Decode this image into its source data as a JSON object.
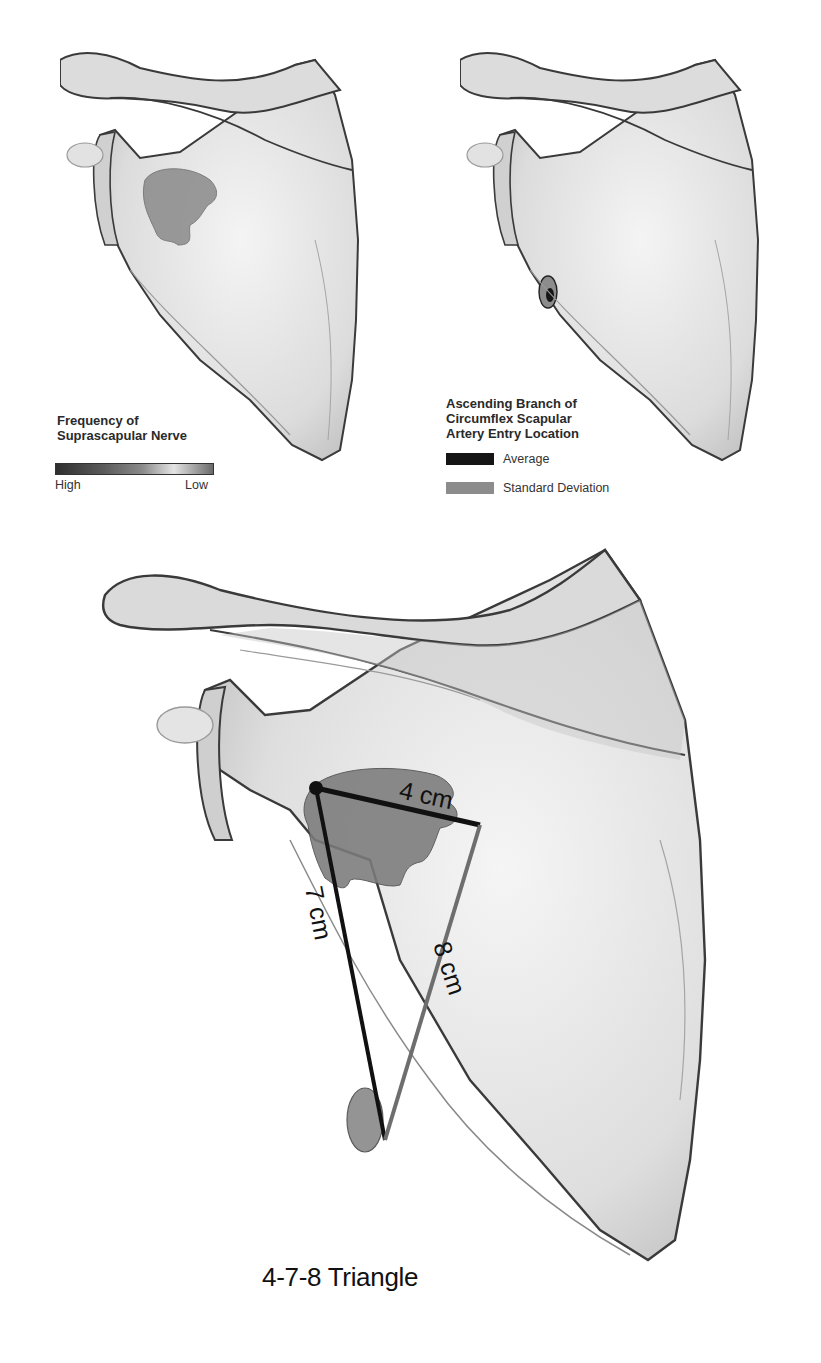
{
  "figure": {
    "panel_a": {
      "legend_title_line1": "Frequency of",
      "legend_title_line2": "Suprascapular Nerve",
      "scale_high": "High",
      "scale_low": "Low"
    },
    "panel_b": {
      "legend_title_line1": "Ascending Branch of",
      "legend_title_line2": "Circumflex Scapular",
      "legend_title_line3": "Artery Entry Location",
      "legend_items": [
        {
          "label": "Average",
          "color": "#151515"
        },
        {
          "label": "Standard Deviation",
          "color": "#8c8c8c"
        }
      ]
    },
    "panel_c": {
      "measurements": {
        "top": "4 cm",
        "left": "7 cm",
        "right": "8 cm"
      },
      "caption": "4-7-8 Triangle"
    }
  },
  "colors": {
    "bone_fill": "#e6e6e6",
    "bone_shade": "#c9c9c9",
    "outline": "#3a3a3a",
    "nerve_zone": "#7a7a7a",
    "triangle_line_dark": "#111111",
    "triangle_line_gray": "#6e6e6e"
  }
}
